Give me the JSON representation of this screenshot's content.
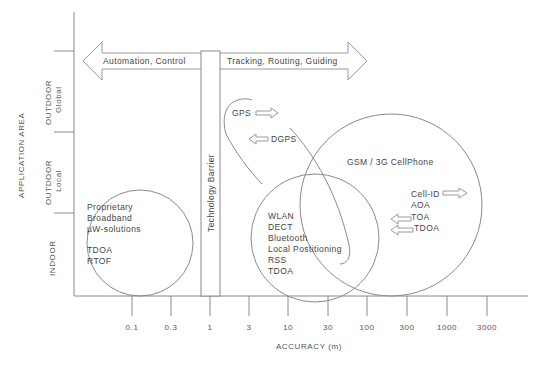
{
  "y_axis": {
    "title": "APPLICATION AREA",
    "zones": [
      {
        "line1": "OUTDOOR",
        "line2": "Global"
      },
      {
        "line1": "OUTDOOR",
        "line2": "Local"
      },
      {
        "line1": "INDOOR",
        "line2": ""
      }
    ]
  },
  "x_axis": {
    "title": "ACCURACY (m)",
    "ticks": [
      "0.1",
      "0.3",
      "1",
      "3",
      "10",
      "30",
      "100",
      "300",
      "1000",
      "3000"
    ]
  },
  "arrows": {
    "left": "Automation, Control",
    "right": "Tracking, Routing, Guiding"
  },
  "barrier": {
    "label": "Technology Barrier"
  },
  "regions": {
    "indoor_proprietary": {
      "lines": [
        "Proprietary",
        "Broadband",
        "µW-solutions",
        "",
        "TDOA",
        "RTOF"
      ]
    },
    "gps": {
      "gps": "GPS",
      "dgps": "DGPS"
    },
    "local": {
      "lines": [
        "WLAN",
        "DECT",
        "Bluetooth",
        "Local Postitioning",
        "RSS",
        "TDOA"
      ]
    },
    "cellular": {
      "title": "GSM / 3G CellPhone",
      "methods": [
        "Cell-ID",
        "AOA",
        "TOA",
        "TDOA"
      ]
    }
  },
  "colors": {
    "line": "#8a8a8a",
    "text": "#444444",
    "background": "#ffffff"
  }
}
